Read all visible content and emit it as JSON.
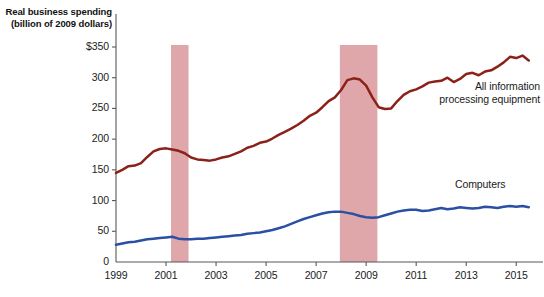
{
  "chart_data": {
    "type": "line",
    "title": "Real business spending (billion of 2009 dollars)",
    "title_line1": "Real business spending",
    "title_line2": "(billion of 2009 dollars)",
    "xlabel": "",
    "ylabel": "Real business spending (billion of 2009 dollars)",
    "xlim": [
      1999,
      2015.75
    ],
    "ylim": [
      0,
      360
    ],
    "grid": false,
    "legend_position": "inline-right",
    "y_ticks": [
      0,
      50,
      100,
      150,
      200,
      250,
      300,
      350
    ],
    "y_tick_labels": [
      "0",
      "50",
      "100",
      "150",
      "200",
      "250",
      "300",
      "$350"
    ],
    "x_ticks": [
      1999,
      2001,
      2003,
      2005,
      2007,
      2009,
      2011,
      2013,
      2015
    ],
    "x_tick_labels": [
      "1999",
      "2001",
      "2003",
      "2005",
      "2007",
      "2009",
      "2011",
      "2013",
      "2015"
    ],
    "colors": {
      "all_information_processing_equipment": "#8b2119",
      "computers": "#2b4fa2",
      "recession_band": "#dfa7aa",
      "axis": "#58585a",
      "text": "#1b1b1b"
    },
    "annotations": [
      {
        "name": "all-information-processing-equipment-label",
        "text": "All information processing equipment",
        "line1": "All information",
        "line2": "processing equipment",
        "x": 2012.6,
        "y": 273
      },
      {
        "name": "computers-label",
        "text": "Computers",
        "line1": "Computers",
        "line2": "",
        "x": 2013.2,
        "y": 122
      }
    ],
    "recessions": [
      {
        "name": "recession-2001",
        "start": 2001.2,
        "end": 2001.9
      },
      {
        "name": "recession-2008-2009",
        "start": 2007.95,
        "end": 2009.45
      }
    ],
    "series": [
      {
        "name": "All information processing equipment",
        "color": "#8b2119",
        "x": [
          1999.0,
          1999.25,
          1999.5,
          1999.75,
          2000.0,
          2000.25,
          2000.5,
          2000.75,
          2001.0,
          2001.25,
          2001.5,
          2001.75,
          2002.0,
          2002.25,
          2002.5,
          2002.75,
          2003.0,
          2003.25,
          2003.5,
          2003.75,
          2004.0,
          2004.25,
          2004.5,
          2004.75,
          2005.0,
          2005.25,
          2005.5,
          2005.75,
          2006.0,
          2006.25,
          2006.5,
          2006.75,
          2007.0,
          2007.25,
          2007.5,
          2007.75,
          2008.0,
          2008.25,
          2008.5,
          2008.75,
          2009.0,
          2009.25,
          2009.5,
          2009.75,
          2010.0,
          2010.25,
          2010.5,
          2010.75,
          2011.0,
          2011.25,
          2011.5,
          2011.75,
          2012.0,
          2012.25,
          2012.5,
          2012.75,
          2013.0,
          2013.25,
          2013.5,
          2013.75,
          2014.0,
          2014.25,
          2014.5,
          2014.75,
          2015.0,
          2015.25,
          2015.5
        ],
        "values": [
          145,
          150,
          156,
          157,
          161,
          171,
          180,
          184,
          185,
          183,
          181,
          177,
          170,
          167,
          166,
          165,
          167,
          170,
          172,
          176,
          180,
          186,
          189,
          194,
          196,
          201,
          207,
          212,
          217,
          223,
          230,
          238,
          243,
          252,
          262,
          268,
          280,
          296,
          299,
          297,
          287,
          268,
          252,
          249,
          250,
          262,
          272,
          278,
          281,
          286,
          292,
          294,
          295,
          300,
          293,
          298,
          306,
          308,
          304,
          310,
          312,
          318,
          325,
          334,
          332,
          336,
          328
        ]
      },
      {
        "name": "Computers",
        "color": "#2b4fa2",
        "x": [
          1999.0,
          1999.25,
          1999.5,
          1999.75,
          2000.0,
          2000.25,
          2000.5,
          2000.75,
          2001.0,
          2001.25,
          2001.5,
          2001.75,
          2002.0,
          2002.25,
          2002.5,
          2002.75,
          2003.0,
          2003.25,
          2003.5,
          2003.75,
          2004.0,
          2004.25,
          2004.5,
          2004.75,
          2005.0,
          2005.25,
          2005.5,
          2005.75,
          2006.0,
          2006.25,
          2006.5,
          2006.75,
          2007.0,
          2007.25,
          2007.5,
          2007.75,
          2008.0,
          2008.25,
          2008.5,
          2008.75,
          2009.0,
          2009.25,
          2009.5,
          2009.75,
          2010.0,
          2010.25,
          2010.5,
          2010.75,
          2011.0,
          2011.25,
          2011.5,
          2011.75,
          2012.0,
          2012.25,
          2012.5,
          2012.75,
          2013.0,
          2013.25,
          2013.5,
          2013.75,
          2014.0,
          2014.25,
          2014.5,
          2014.75,
          2015.0,
          2015.25,
          2015.5
        ],
        "values": [
          28,
          30,
          32,
          33,
          35,
          37,
          38,
          39,
          40,
          41,
          38,
          37,
          37,
          38,
          38,
          39,
          40,
          41,
          42,
          43,
          44,
          46,
          47,
          48,
          50,
          52,
          55,
          58,
          62,
          66,
          70,
          73,
          76,
          79,
          81,
          82,
          82,
          80,
          78,
          75,
          73,
          72,
          73,
          76,
          79,
          82,
          84,
          85,
          85,
          83,
          84,
          86,
          88,
          86,
          87,
          89,
          88,
          87,
          88,
          90,
          89,
          88,
          90,
          91,
          90,
          91,
          89
        ]
      }
    ]
  }
}
